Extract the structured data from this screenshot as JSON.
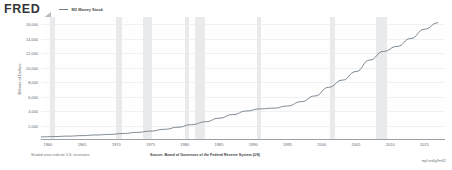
{
  "header": {
    "logo": "FRED",
    "logo_icon": "fred-swoosh-icon",
    "legend": {
      "swatch_color": "#6f7b84",
      "label": "M3 Money Stock"
    }
  },
  "footer": {
    "note_left": "Shaded areas indicate U.S. recessions",
    "source": "Source: Board of Governors of the Federal Reserve System (US)",
    "url": "myf.red/g/fmS2"
  },
  "chart_data": {
    "type": "line",
    "title": "M3 Money Stock",
    "xlabel": "",
    "ylabel": "Billions of Dollars",
    "ylim": [
      0,
      17000
    ],
    "xlim": [
      1959,
      2018
    ],
    "grid": true,
    "legend_position": "top-left",
    "line_color": "#6f7b84",
    "recession_color": "#e9eaec",
    "ytick_labels": [
      "16,000",
      "14,000",
      "12,000",
      "10,000",
      "8,000",
      "6,000",
      "4,000",
      "2,000"
    ],
    "ytick_values": [
      16000,
      14000,
      12000,
      10000,
      8000,
      6000,
      4000,
      2000
    ],
    "xtick_labels": [
      "1960",
      "1965",
      "1970",
      "1975",
      "1980",
      "1985",
      "1990",
      "1995",
      "2000",
      "2005",
      "2010",
      "2015"
    ],
    "xtick_values": [
      1960,
      1965,
      1970,
      1975,
      1980,
      1985,
      1990,
      1995,
      2000,
      2005,
      2010,
      2015
    ],
    "x": [
      1959,
      1961,
      1963,
      1965,
      1967,
      1969,
      1971,
      1973,
      1975,
      1977,
      1979,
      1981,
      1983,
      1985,
      1987,
      1989,
      1991,
      1993,
      1995,
      1997,
      1999,
      2001,
      2003,
      2005,
      2007,
      2009,
      2011,
      2013,
      2015,
      2017
    ],
    "values": [
      300,
      340,
      400,
      470,
      560,
      640,
      760,
      920,
      1100,
      1350,
      1640,
      2000,
      2400,
      2900,
      3400,
      3900,
      4200,
      4300,
      4600,
      5200,
      6000,
      7200,
      8200,
      9400,
      11000,
      12200,
      12900,
      14000,
      15300,
      16200
    ],
    "recessions": [
      {
        "start": 1960.3,
        "end": 1961.1
      },
      {
        "start": 1969.9,
        "end": 1970.9
      },
      {
        "start": 1973.9,
        "end": 1975.2
      },
      {
        "start": 1980.0,
        "end": 1980.6
      },
      {
        "start": 1981.5,
        "end": 1982.9
      },
      {
        "start": 1990.6,
        "end": 1991.2
      },
      {
        "start": 2001.2,
        "end": 2001.9
      },
      {
        "start": 2007.9,
        "end": 2009.5
      }
    ]
  }
}
